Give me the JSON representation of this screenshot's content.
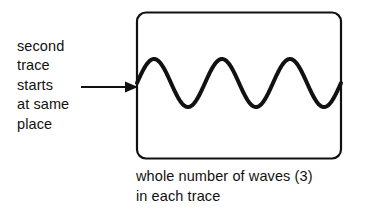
{
  "figure": {
    "kind": "oscilloscope-trace-diagram",
    "background_color": "#ffffff",
    "ink_color": "#111111"
  },
  "annotation": {
    "name": "second-trace-annotation",
    "lines": [
      "second",
      "trace",
      "starts",
      "at same",
      "place"
    ],
    "arrow": {
      "name": "pointer-arrow",
      "direction": "right",
      "points_to": "wave-start-point"
    }
  },
  "screen": {
    "name": "oscilloscope-screen",
    "border_color": "#111111",
    "fill_color": "#ffffff",
    "corner_radius_px": 9,
    "border_width_px": 2.2
  },
  "caption": {
    "name": "figure-caption",
    "lines": [
      "whole number of waves (3)",
      "in each trace"
    ]
  },
  "chart_data": {
    "type": "line",
    "title": "",
    "subtitle": "",
    "xlabel": "",
    "ylabel": "",
    "grid": false,
    "legend": null,
    "annotations": [
      "second trace starts at same place",
      "whole number of waves (3) in each trace"
    ],
    "series": [
      {
        "name": "trace",
        "waveform": "sine",
        "cycles": 3,
        "amplitude": 1,
        "phase_deg": 0,
        "stroke_color": "#111111",
        "stroke_width_px": 4,
        "x": [
          0,
          0.125,
          0.25,
          0.375,
          0.5,
          0.625,
          0.75,
          0.875,
          1.0,
          1.125,
          1.25,
          1.375,
          1.5,
          1.625,
          1.75,
          1.875,
          2.0,
          2.125,
          2.25,
          2.375,
          2.5,
          2.625,
          2.75,
          2.875,
          3.0
        ],
        "values": [
          0,
          0.707,
          1,
          0.707,
          0,
          -0.707,
          -1,
          -0.707,
          0,
          0.707,
          1,
          0.707,
          0,
          -0.707,
          -1,
          -0.707,
          0,
          0.707,
          1,
          0.707,
          0,
          -0.707,
          -1,
          -0.707,
          0
        ]
      }
    ],
    "xlim": [
      0,
      3
    ],
    "ylim": [
      -1,
      1
    ]
  }
}
